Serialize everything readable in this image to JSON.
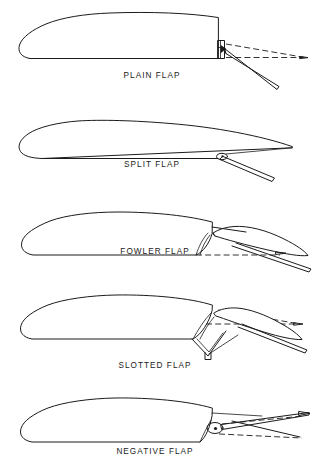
{
  "figure": {
    "title_visible": false,
    "background_color": "#ffffff",
    "line_color": "#1b1b1b",
    "panel_count": 5
  },
  "panels": [
    {
      "id": "plain-flap",
      "label": "PLAIN FLAP",
      "label_x": 152,
      "label_y": 78,
      "deflection": "down",
      "has_dashed_reference": true,
      "description_visible_elements": [
        "airfoil-outline",
        "hinge-bracket",
        "deflected-flap",
        "dashed-undeflected-line"
      ]
    },
    {
      "id": "split-flap",
      "label": "SPLIT FLAP",
      "label_x": 152,
      "label_y": 167,
      "deflection": "down",
      "has_dashed_reference": false,
      "description_visible_elements": [
        "airfoil-outline",
        "hinge-point",
        "split-plate-flap"
      ]
    },
    {
      "id": "fowler-flap",
      "label": "FOWLER FLAP",
      "label_x": 155,
      "label_y": 254,
      "deflection": "down-and-aft",
      "has_dashed_reference": true,
      "description_visible_elements": [
        "airfoil-outline",
        "extended-flap",
        "dashed-retracted-outline",
        "track-slot"
      ]
    },
    {
      "id": "slotted-flap",
      "label": "SLOTTED FLAP",
      "label_x": 155,
      "label_y": 368,
      "deflection": "down",
      "has_dashed_reference": true,
      "description_visible_elements": [
        "airfoil-outline",
        "slot-gap",
        "deflected-flap",
        "v-linkage-arm",
        "dashed-undeflected-line"
      ]
    },
    {
      "id": "negative-flap",
      "label": "NEGATIVE FLAP",
      "label_x": 155,
      "label_y": 454,
      "deflection": "up",
      "has_dashed_reference": true,
      "description_visible_elements": [
        "airfoil-outline",
        "pivot-dot",
        "upward-deflected-flap",
        "dashed-undeflected-line"
      ]
    }
  ]
}
